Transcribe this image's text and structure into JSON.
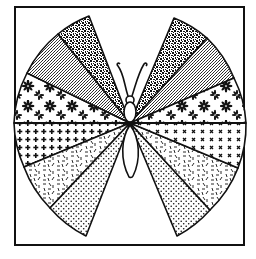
{
  "illustration": {
    "title": "Patchwork butterfly",
    "description": "Black and white line drawing of a butterfly whose wings form a circle divided into patterned wedges, inside a square frame",
    "colors": {
      "ink": "#111111",
      "paper": "#ffffff"
    },
    "frame": {
      "x": 14,
      "y": 6,
      "width": 231,
      "height": 240
    },
    "center": {
      "x": 130,
      "y": 123
    },
    "radius": 117,
    "wedges": [
      {
        "name": "upper-left-outer",
        "pattern": "dense-speckle",
        "from_deg": 200,
        "to_deg": 235
      },
      {
        "name": "upper-left-mid",
        "pattern": "fine-stipple",
        "from_deg": 160,
        "to_deg": 200
      },
      {
        "name": "upper-left-floral",
        "pattern": "floral",
        "from_deg": 90,
        "to_deg": 160
      },
      {
        "name": "upper-right-outer",
        "pattern": "dense-speckle",
        "from_deg": -55,
        "to_deg": -20
      },
      {
        "name": "upper-right-mid",
        "pattern": "fine-stipple",
        "from_deg": -20,
        "to_deg": 20
      },
      {
        "name": "upper-right-floral",
        "pattern": "floral",
        "from_deg": 20,
        "to_deg": 90
      },
      {
        "name": "lower-left-plus",
        "pattern": "plus-grid",
        "side": "left"
      },
      {
        "name": "lower-left-confetti",
        "pattern": "dashes",
        "side": "left"
      },
      {
        "name": "lower-left-dots",
        "pattern": "dots",
        "side": "left"
      },
      {
        "name": "lower-right-cross",
        "pattern": "x-grid",
        "side": "right"
      },
      {
        "name": "lower-right-confetti",
        "pattern": "dashes",
        "side": "right"
      },
      {
        "name": "lower-right-dots",
        "pattern": "dots",
        "side": "right"
      }
    ],
    "body_parts": [
      "antennae",
      "head",
      "thorax",
      "abdomen"
    ]
  }
}
